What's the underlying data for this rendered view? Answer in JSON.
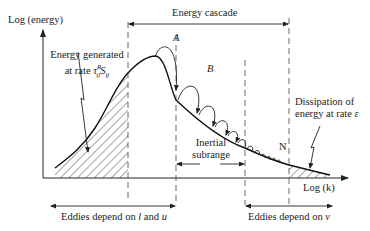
{
  "diagram": {
    "y_axis_label": "Log (energy)",
    "x_axis_label": "Log (k)",
    "top_span_label": "Energy cascade",
    "production_label_line1": "Energy generated",
    "production_label_line2_prefix": "at rate ",
    "production_rate_symbol": "τ",
    "production_rate_sup": "R",
    "production_rate_sub1": "ij",
    "production_rate_S": "S",
    "production_rate_sub2": "ij",
    "point_a": "A",
    "point_b": "B",
    "point_n": "N",
    "inertial_label_line1": "Inertial",
    "inertial_label_line2": "subrange",
    "dissipation_label_line1": "Dissipation of",
    "dissipation_label_line2_prefix": "energy at rate ",
    "dissipation_symbol": "ε",
    "bottom_left_label_prefix": "Eddies depend on ",
    "bottom_left_l": "l",
    "bottom_left_and": " and ",
    "bottom_left_u": "u",
    "bottom_right_label_prefix": "Eddies depend on ",
    "bottom_right_nu": "v",
    "colors": {
      "line": "#222222",
      "background": "#ffffff"
    }
  }
}
